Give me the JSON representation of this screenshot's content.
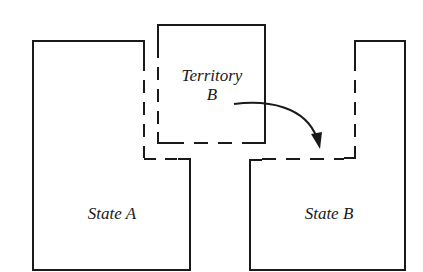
{
  "diagram": {
    "line_color": "#1a1a1a",
    "background": "#ffffff",
    "regions": {
      "state_a": {
        "label": "State A"
      },
      "territory_b": {
        "label_line1": "Territory",
        "label_line2": "B"
      },
      "state_b": {
        "label": "State B"
      }
    },
    "arrow": {
      "from": "Territory B",
      "to": "State B",
      "meaning": "territory transfer"
    }
  }
}
